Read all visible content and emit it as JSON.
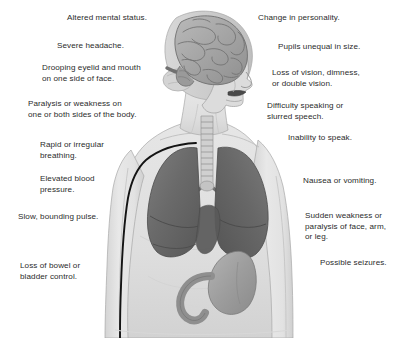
{
  "figure": {
    "background_color": "#ffffff",
    "text_color": "#2b2b2b",
    "body_fill_color": "#e4e4e4",
    "organ_fill_color": "#6e6e6e",
    "outline_color": "#8a8a8a",
    "accent_line_color": "#1a1a1a"
  },
  "anatomy": {
    "parts": [
      {
        "name": "head-profile",
        "label": "Head shown in right profile"
      },
      {
        "name": "brain",
        "label": "Brain with gyri and sulci"
      },
      {
        "name": "trachea",
        "label": "Trachea with cartilage rings"
      },
      {
        "name": "lung-left",
        "label": "Left lung"
      },
      {
        "name": "lung-right",
        "label": "Right lung"
      },
      {
        "name": "stomach",
        "label": "Stomach and duodenum"
      },
      {
        "name": "torso",
        "label": "Upper torso and arms"
      },
      {
        "name": "aorta-line",
        "label": "Dark vessel line along left torso"
      }
    ]
  },
  "labels_left": [
    {
      "id": "altered-mental-status",
      "text": "Altered mental status.",
      "x": 67,
      "y": 13
    },
    {
      "id": "severe-headache",
      "text": "Severe headache.",
      "x": 57,
      "y": 41
    },
    {
      "id": "drooping-eyelid-and-mouth",
      "text": "Drooping eyelid and mouth\non one side of face.",
      "x": 42,
      "y": 63
    },
    {
      "id": "paralysis-or-weakness",
      "text": "Paralysis or weakness on\none or both sides of the body.",
      "x": 28,
      "y": 99
    },
    {
      "id": "rapid-or-irregular-breathing",
      "text": "Rapid or irregular\nbreathing.",
      "x": 40,
      "y": 140
    },
    {
      "id": "elevated-blood-pressure",
      "text": "Elevated blood\npressure.",
      "x": 40,
      "y": 174
    },
    {
      "id": "slow-bounding-pulse",
      "text": "Slow, bounding pulse.",
      "x": 18,
      "y": 212
    },
    {
      "id": "loss-of-bowel-or-bladder-control",
      "text": "Loss of bowel or\nbladder control.",
      "x": 20,
      "y": 261
    }
  ],
  "labels_right": [
    {
      "id": "change-in-personality",
      "text": "Change in personality.",
      "x": 258,
      "y": 13
    },
    {
      "id": "pupils-unequal-in-size",
      "text": "Pupils unequal in size.",
      "x": 278,
      "y": 42
    },
    {
      "id": "loss-of-vision-dimness",
      "text": "Loss of vision, dimness,\nor double vision.",
      "x": 272,
      "y": 68
    },
    {
      "id": "difficulty-speaking",
      "text": "Difficulty speaking or\nslurred speech.",
      "x": 267,
      "y": 101
    },
    {
      "id": "inability-to-speak",
      "text": "Inability to speak.",
      "x": 288,
      "y": 133
    },
    {
      "id": "nausea-or-vomiting",
      "text": "Nausea or vomiting.",
      "x": 303,
      "y": 176
    },
    {
      "id": "sudden-weakness-or-paralysis",
      "text": "Sudden weakness or\nparalysis of face, arm,\nor leg.",
      "x": 305,
      "y": 211
    },
    {
      "id": "possible-seizures",
      "text": "Possible seizures.",
      "x": 320,
      "y": 258
    }
  ]
}
